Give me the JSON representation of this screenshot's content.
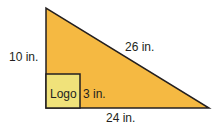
{
  "diagram": {
    "shape": "right-triangle",
    "colors": {
      "triangle_fill": "#F5B942",
      "logo_fill": "#F0E27A",
      "stroke": "#231f20"
    },
    "labels": {
      "height": "10 in.",
      "hypotenuse": "26 in.",
      "base": "24 in.",
      "logo": "Logo",
      "logo_side": "3 in."
    }
  }
}
